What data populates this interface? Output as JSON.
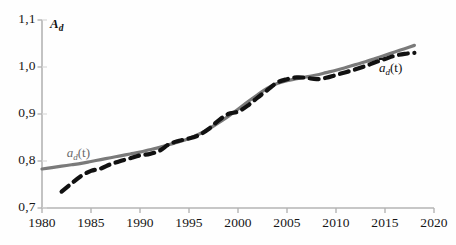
{
  "chart_data": {
    "type": "line",
    "title": "",
    "xlabel": "",
    "ylabel": "A_d",
    "ylabel_text": "A",
    "ylabel_sub": "d",
    "xlim": [
      1980,
      2020
    ],
    "ylim": [
      0.7,
      1.1
    ],
    "grid": false,
    "legend_position": "inline-annotations",
    "decimal_separator": ",",
    "xticks": [
      "1980",
      "1985",
      "1990",
      "1995",
      "2000",
      "2005",
      "2010",
      "2015",
      "2020"
    ],
    "xtick_values": [
      1980,
      1985,
      1990,
      1995,
      2000,
      2005,
      2010,
      2015,
      2020
    ],
    "yticks": [
      "0,7",
      "0,8",
      "0,9",
      "1,0",
      "1,1"
    ],
    "ytick_values": [
      0.7,
      0.8,
      0.9,
      1.0,
      1.1
    ],
    "series": [
      {
        "name": "a_d(t)",
        "label_text": "a",
        "label_sub": "d",
        "label_suffix": "(t)",
        "style": "solid",
        "color": "#7a7a7a",
        "width": 3.2,
        "annotation_x": 1981.5,
        "annotation_y": 0.815,
        "x": [
          1980,
          1981,
          1982,
          1983,
          1984,
          1985,
          1986,
          1987,
          1988,
          1989,
          1990,
          1991,
          1992,
          1993,
          1994,
          1995,
          1996,
          1997,
          1998,
          1999,
          2000,
          2001,
          2002,
          2003,
          2004,
          2005,
          2006,
          2007,
          2008,
          2009,
          2010,
          2011,
          2012,
          2013,
          2014,
          2015,
          2016,
          2017,
          2018
        ],
        "values": [
          0.783,
          0.786,
          0.789,
          0.792,
          0.795,
          0.799,
          0.803,
          0.807,
          0.811,
          0.815,
          0.819,
          0.824,
          0.829,
          0.835,
          0.841,
          0.848,
          0.857,
          0.868,
          0.881,
          0.895,
          0.91,
          0.926,
          0.941,
          0.955,
          0.965,
          0.971,
          0.975,
          0.979,
          0.983,
          0.988,
          0.993,
          0.999,
          1.005,
          1.011,
          1.018,
          1.025,
          1.032,
          1.039,
          1.046
        ]
      },
      {
        "name": "abar_d(t)",
        "label_text": "a",
        "label_sub": "d",
        "label_suffix": "(t)",
        "label_overbar": true,
        "style": "dashed",
        "color": "#111111",
        "width": 4.2,
        "annotation_x": 2015.2,
        "annotation_y": 0.996,
        "x": [
          1982,
          1983,
          1984,
          1985,
          1986,
          1987,
          1988,
          1989,
          1990,
          1991,
          1992,
          1993,
          1994,
          1995,
          1996,
          1997,
          1998,
          1999,
          2000,
          2001,
          2002,
          2003,
          2004,
          2005,
          2006,
          2007,
          2008,
          2009,
          2010,
          2011,
          2012,
          2013,
          2014,
          2015,
          2016,
          2017,
          2018
        ],
        "values": [
          0.735,
          0.752,
          0.768,
          0.779,
          0.784,
          0.793,
          0.8,
          0.806,
          0.812,
          0.815,
          0.822,
          0.836,
          0.843,
          0.848,
          0.855,
          0.868,
          0.886,
          0.9,
          0.905,
          0.918,
          0.935,
          0.951,
          0.967,
          0.974,
          0.978,
          0.977,
          0.974,
          0.977,
          0.983,
          0.989,
          0.995,
          1.002,
          1.01,
          1.017,
          1.024,
          1.028,
          1.03
        ]
      }
    ]
  },
  "axes": {
    "axis_color": "#b4b4b4",
    "tick_color": "#b4b4b4"
  }
}
